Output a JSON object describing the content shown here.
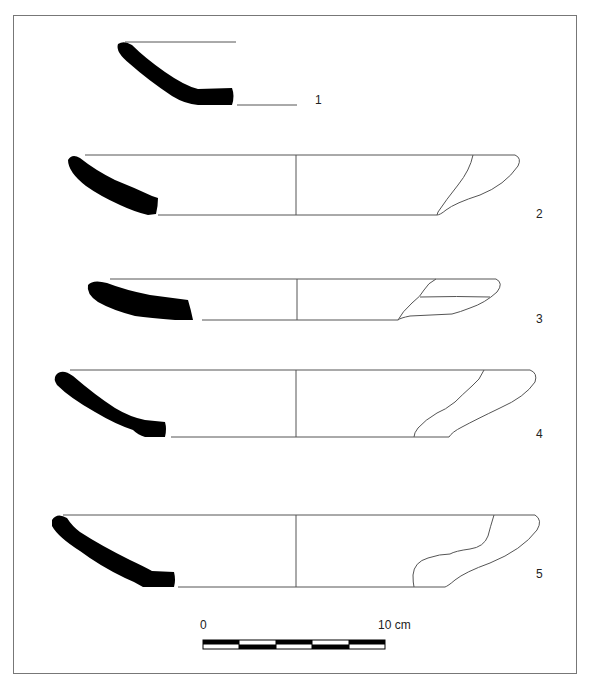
{
  "figure": {
    "type": "archaeological pottery profile drawings",
    "vessels": [
      {
        "number": "1"
      },
      {
        "number": "2"
      },
      {
        "number": "3"
      },
      {
        "number": "4"
      },
      {
        "number": "5"
      }
    ],
    "scale_bar": {
      "start_label": "0",
      "end_label": "10 cm",
      "segments": 5
    },
    "colors": {
      "section_fill": "#000000",
      "line": "#555555",
      "frame": "#777777"
    }
  }
}
